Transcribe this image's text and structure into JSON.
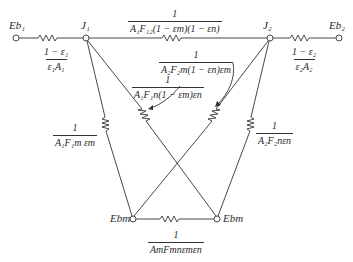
{
  "diagram": {
    "type": "radiation-network",
    "line_color": "#333333",
    "nodes": {
      "eb1": {
        "label": "E_b1",
        "text": "Eb₁",
        "x": 16,
        "y": 38
      },
      "j1": {
        "label": "J_1",
        "text": "J₁",
        "x": 86,
        "y": 38
      },
      "j2": {
        "label": "J_2",
        "text": "J₂",
        "x": 270,
        "y": 38
      },
      "eb2": {
        "label": "E_b2",
        "text": "Eb₂",
        "x": 339,
        "y": 38
      },
      "ebm_left": {
        "label": "E_bm",
        "text": "Ebm",
        "x": 133,
        "y": 219
      },
      "ebm_right": {
        "label": "E_bm",
        "text": "Ebm",
        "x": 217,
        "y": 219
      }
    },
    "resistances": {
      "r_surface1": {
        "num": "1 − ε₁",
        "den": "ε₁A₁"
      },
      "r_j1_j2": {
        "num": "1",
        "den": "A₁F₁₂(1 − εm)(1 − εn)"
      },
      "r_surface2": {
        "num": "1 − ε₂",
        "den": "ε₂A₂"
      },
      "r_j2_ebm_cross": {
        "num": "1",
        "den": "A₂F₂m(1 − εn)εm"
      },
      "r_j1_ebm_cross": {
        "num": "1",
        "den": "A₁F₁n(1 − εm)εn"
      },
      "r_j1_ebm": {
        "num": "1",
        "den": "A₁F₁m εm"
      },
      "r_j2_ebn": {
        "num": "1",
        "den": "A₂F₂nεn"
      },
      "r_ebm_ebn": {
        "num": "1",
        "den": "AmFmnεmεn"
      }
    }
  }
}
